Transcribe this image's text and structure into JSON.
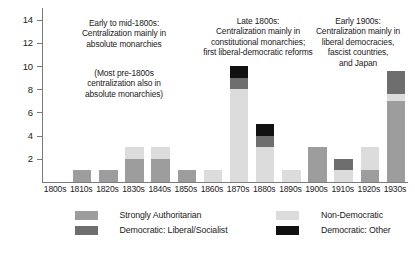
{
  "chart_data": {
    "type": "bar",
    "title": "",
    "xlabel": "",
    "ylabel": "",
    "stacked": true,
    "grid": false,
    "ylim": [
      0,
      15
    ],
    "yticks": [
      2,
      4,
      6,
      8,
      10,
      12,
      14
    ],
    "categories": [
      "1800s",
      "1810s",
      "1820s",
      "1830s",
      "1840s",
      "1850s",
      "1860s",
      "1870s",
      "1880s",
      "1890s",
      "1900s",
      "1910s",
      "1920s",
      "1930s"
    ],
    "series": [
      {
        "name": "Strongly Authoritarian",
        "color": "#9d9d9d",
        "values": [
          0,
          1,
          1,
          2,
          2,
          1,
          0,
          0,
          0,
          0,
          3,
          0,
          1,
          7
        ]
      },
      {
        "name": "Non-Democratic",
        "color": "#dcdcdc",
        "values": [
          0,
          0,
          0,
          1,
          1,
          0,
          1,
          8,
          3,
          1,
          0,
          1,
          2,
          0.6
        ]
      },
      {
        "name": "Democratic: Liberal/Socialist",
        "color": "#6e6e6e",
        "values": [
          0,
          0,
          0,
          0,
          0,
          0,
          0,
          1,
          1,
          0,
          0,
          1,
          0,
          2
        ]
      },
      {
        "name": "Democratic: Other",
        "color": "#111111",
        "values": [
          0,
          0,
          0,
          0,
          0,
          0,
          0,
          1,
          1,
          0,
          0,
          0,
          0,
          0
        ]
      }
    ],
    "legend_position": "bottom",
    "annotations": [
      {
        "id": "early-to-mid-1800s",
        "lines": [
          "Early to mid-1800s:",
          "Centralization mainly in",
          "absolute monarchies"
        ]
      },
      {
        "id": "pre-1800s-note",
        "lines": [
          "(Most pre-1800s",
          "centralization also in",
          "absolute monarchies)"
        ]
      },
      {
        "id": "late-1800s",
        "lines": [
          "Late 1800s:",
          "Centralization mainly in",
          "constitutional monarchies;",
          "first liberal-democratic reforms"
        ]
      },
      {
        "id": "early-1900s",
        "lines": [
          "Early 1900s:",
          "Centralization mainly in",
          "liberal democracies,",
          "fascist countries,",
          "and Japan"
        ]
      }
    ]
  },
  "legend": {
    "entries": [
      {
        "label": "Strongly Authoritarian",
        "swatch": "sw-auth"
      },
      {
        "label": "Non-Democratic",
        "swatch": "sw-nondem"
      },
      {
        "label": "Democratic: Liberal/Socialist",
        "swatch": "sw-libsoc"
      },
      {
        "label": "Democratic: Other",
        "swatch": "sw-demother"
      }
    ]
  }
}
